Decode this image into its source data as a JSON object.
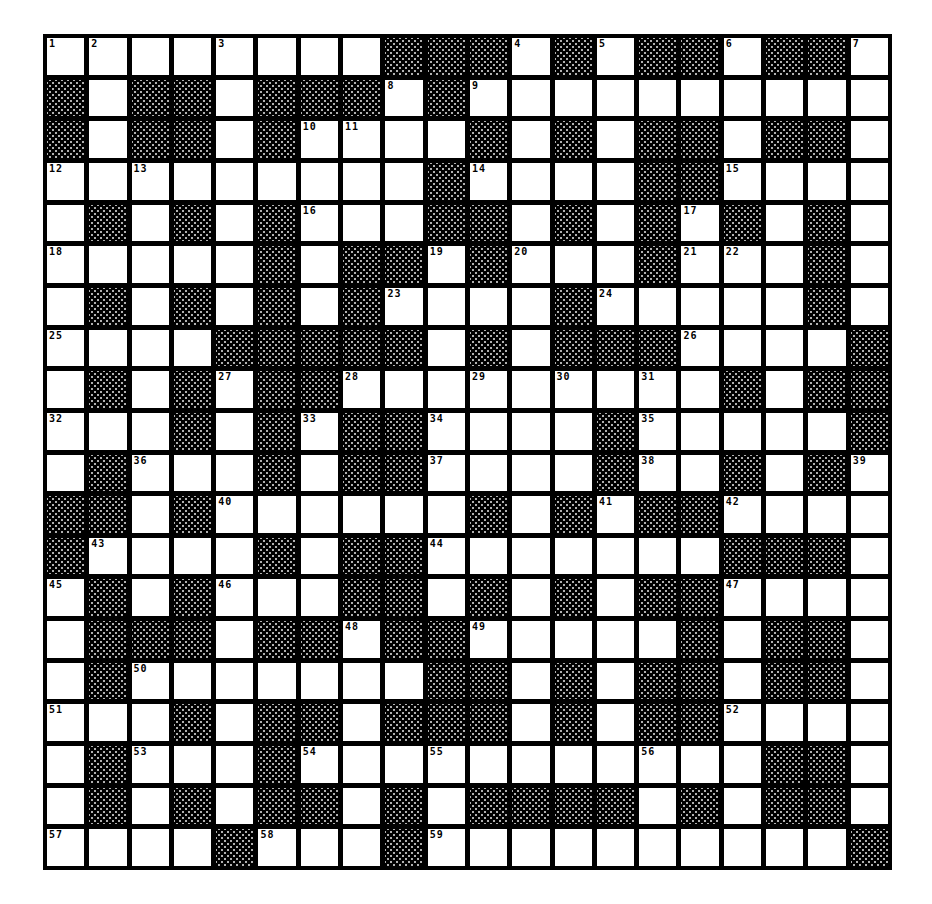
{
  "puzzle": {
    "type": "crossword",
    "rows": 20,
    "cols": 20,
    "colors": {
      "grid_line": "#000000",
      "cell": "#ffffff",
      "block_pattern": "#000000"
    },
    "grid": [
      "WWWWWWWWBBBWBWBBWBBW",
      "BWBBWBBBWBWWWWWWWWWW",
      "BWBBWBWWWWBWBWBBWBBW",
      "WWWWWWWWWBWWWWBBWWWW",
      "WBWBWBWWWBBWBWBWBWBW",
      "WWWWWBWBBWBWWWBWWWBW",
      "WBWBWBWBWWWWBWWWWWBW",
      "WWWWBBBBBWBWBBBWWWWB",
      "WBWBWBBWWWWWWWWWBWBB",
      "WWWBWBWBBWWWWBWWWWWB",
      "WBWWWBWBBWWWWBWWBWBW",
      "BBWBWWWWWWBWBWBBWWWW",
      "BWWWWBWBBWWWWWWWBBBW",
      "WBWBWWWBBWBWBWBBWWWW",
      "WBBBWBBWBBWWWWWBWBBW",
      "WBWWWWWWWBBWBWBBWBBW",
      "WWWBWBBWBBBWBWBBWWWW",
      "WBWWWBWWWWWWWWWWWBBW",
      "WBWBWBBWBWBBBBWBWBBW",
      "WWWWBWWWBWWWWWWWWWWB"
    ],
    "numbers": [
      {
        "n": "1",
        "r": 0,
        "c": 0
      },
      {
        "n": "2",
        "r": 0,
        "c": 1
      },
      {
        "n": "3",
        "r": 0,
        "c": 4
      },
      {
        "n": "4",
        "r": 0,
        "c": 11
      },
      {
        "n": "5",
        "r": 0,
        "c": 13
      },
      {
        "n": "6",
        "r": 0,
        "c": 16
      },
      {
        "n": "7",
        "r": 0,
        "c": 19
      },
      {
        "n": "8",
        "r": 1,
        "c": 8
      },
      {
        "n": "9",
        "r": 1,
        "c": 10
      },
      {
        "n": "10",
        "r": 2,
        "c": 6
      },
      {
        "n": "11",
        "r": 2,
        "c": 7
      },
      {
        "n": "12",
        "r": 3,
        "c": 0
      },
      {
        "n": "13",
        "r": 3,
        "c": 2
      },
      {
        "n": "14",
        "r": 3,
        "c": 10
      },
      {
        "n": "15",
        "r": 3,
        "c": 16
      },
      {
        "n": "16",
        "r": 4,
        "c": 6
      },
      {
        "n": "17",
        "r": 4,
        "c": 15
      },
      {
        "n": "18",
        "r": 5,
        "c": 0
      },
      {
        "n": "19",
        "r": 5,
        "c": 9
      },
      {
        "n": "20",
        "r": 5,
        "c": 11
      },
      {
        "n": "21",
        "r": 5,
        "c": 15
      },
      {
        "n": "22",
        "r": 5,
        "c": 16
      },
      {
        "n": "23",
        "r": 6,
        "c": 8
      },
      {
        "n": "24",
        "r": 6,
        "c": 13
      },
      {
        "n": "25",
        "r": 7,
        "c": 0
      },
      {
        "n": "26",
        "r": 7,
        "c": 15
      },
      {
        "n": "27",
        "r": 8,
        "c": 4
      },
      {
        "n": "28",
        "r": 8,
        "c": 7
      },
      {
        "n": "29",
        "r": 8,
        "c": 10
      },
      {
        "n": "30",
        "r": 8,
        "c": 12
      },
      {
        "n": "31",
        "r": 8,
        "c": 14
      },
      {
        "n": "32",
        "r": 9,
        "c": 0
      },
      {
        "n": "33",
        "r": 9,
        "c": 6
      },
      {
        "n": "34",
        "r": 9,
        "c": 9
      },
      {
        "n": "35",
        "r": 9,
        "c": 14
      },
      {
        "n": "36",
        "r": 10,
        "c": 2
      },
      {
        "n": "37",
        "r": 10,
        "c": 9
      },
      {
        "n": "38",
        "r": 10,
        "c": 14
      },
      {
        "n": "39",
        "r": 10,
        "c": 19
      },
      {
        "n": "40",
        "r": 11,
        "c": 4
      },
      {
        "n": "41",
        "r": 11,
        "c": 13
      },
      {
        "n": "42",
        "r": 11,
        "c": 16
      },
      {
        "n": "43",
        "r": 12,
        "c": 1
      },
      {
        "n": "44",
        "r": 12,
        "c": 9
      },
      {
        "n": "45",
        "r": 13,
        "c": 0
      },
      {
        "n": "46",
        "r": 13,
        "c": 4
      },
      {
        "n": "47",
        "r": 13,
        "c": 16
      },
      {
        "n": "48",
        "r": 14,
        "c": 7
      },
      {
        "n": "49",
        "r": 14,
        "c": 10
      },
      {
        "n": "50",
        "r": 15,
        "c": 2
      },
      {
        "n": "51",
        "r": 16,
        "c": 0
      },
      {
        "n": "52",
        "r": 16,
        "c": 16
      },
      {
        "n": "53",
        "r": 17,
        "c": 2
      },
      {
        "n": "54",
        "r": 17,
        "c": 6
      },
      {
        "n": "55",
        "r": 17,
        "c": 9
      },
      {
        "n": "56",
        "r": 17,
        "c": 14
      },
      {
        "n": "57",
        "r": 19,
        "c": 0
      },
      {
        "n": "58",
        "r": 19,
        "c": 5
      },
      {
        "n": "59",
        "r": 19,
        "c": 9
      }
    ]
  }
}
